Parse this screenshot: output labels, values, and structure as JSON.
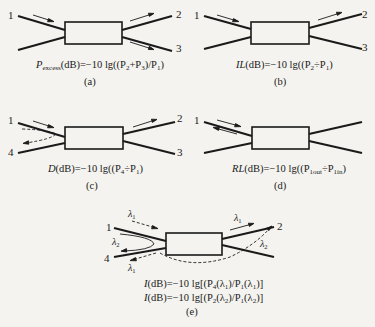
{
  "figure": {
    "panels": [
      {
        "id": "a",
        "caption": "(a)",
        "ports": {
          "p1": "1",
          "p2": "2",
          "p3": "3"
        },
        "formula": {
          "symbol": "P",
          "symbol_sub": "excess",
          "unit": "(dB)=−10 lg((P",
          "t1_sub": "2",
          "plus": "+P",
          "t2_sub": "3",
          "div": ")/P",
          "t3_sub": "1",
          "end": ")"
        }
      },
      {
        "id": "b",
        "caption": "(b)",
        "ports": {
          "p1": "1",
          "p2": "2",
          "p3": "3"
        },
        "formula": {
          "symbol": "IL",
          "unit": "(dB)=−10 lg((P",
          "t1_sub": "2",
          "op": "÷P",
          "t2_sub": "1",
          "end": ")"
        }
      },
      {
        "id": "c",
        "caption": "(c)",
        "ports": {
          "p1": "1",
          "p2": "2",
          "p3": "3",
          "p4": "4"
        },
        "formula": {
          "symbol": "D",
          "unit": "(dB)=−10 lg((P",
          "t1_sub": "4",
          "op": "÷P",
          "t2_sub": "1",
          "end": ")"
        }
      },
      {
        "id": "d",
        "caption": "(d)",
        "ports": {
          "p1": "1"
        },
        "formula": {
          "symbol": "RL",
          "unit": "(dB)=−10 lg((P",
          "t1_sub": "1out",
          "op": "÷P",
          "t2_sub": "1in",
          "end": ")"
        }
      },
      {
        "id": "e",
        "caption": "(e)",
        "ports": {
          "p1": "1",
          "p2": "2",
          "p4": "4"
        },
        "wavelengths": {
          "l1": "λ",
          "l1_sub": "1",
          "l2": "λ",
          "l2_sub": "2"
        },
        "formulas": [
          {
            "symbol": "I",
            "unit": "(dB)=−10 lg[(P",
            "a_sub": "4",
            "a_arg": "(λ",
            "a_arg_sub": "1",
            "mid": ")/P",
            "b_sub": "1",
            "b_arg": "(λ",
            "b_arg_sub": "1",
            "end": ")]"
          },
          {
            "symbol": "I",
            "unit": "(dB)=−10 lg[(P",
            "a_sub": "2",
            "a_arg": "(λ",
            "a_arg_sub": "2",
            "mid": ")/P",
            "b_sub": "1",
            "b_arg": "(λ",
            "b_arg_sub": "2",
            "end": ")]"
          }
        ]
      }
    ]
  }
}
